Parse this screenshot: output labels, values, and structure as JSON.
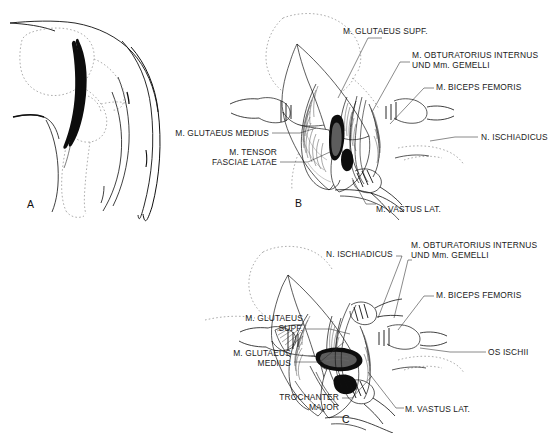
{
  "figure": {
    "kind": "anatomical-surgical-illustration",
    "background_color": "#ffffff",
    "ink_color": "#101010",
    "panels": [
      {
        "id": "A",
        "letter": "A",
        "name": "panel-a-incision-diagram",
        "caption": "",
        "elements": [
          "body-outline",
          "dotted-pelvis-bone",
          "dotted-femur-bone",
          "incision-line"
        ]
      },
      {
        "id": "B",
        "letter": "B",
        "name": "panel-b-superficial-exposure",
        "caption": "",
        "elements": [
          "skin-flap",
          "retractor-left",
          "retractor-right",
          "muscle-bellies",
          "wound-cavity"
        ]
      },
      {
        "id": "C",
        "letter": "C",
        "name": "panel-c-deep-exposure",
        "caption": "",
        "elements": [
          "skin-flap",
          "retractor-left",
          "retractor-right",
          "retractor-lower",
          "muscle-bellies",
          "deep-wound-cavity",
          "bone-surface"
        ]
      }
    ],
    "labels_panel_b": [
      {
        "id": "b-glutaeus-supf",
        "text": "M. GLUTAEUS SUPF.",
        "align": "left"
      },
      {
        "id": "b-obturatorius",
        "text": "M. OBTURATORIUS INTERNUS",
        "align": "left"
      },
      {
        "id": "b-obturatorius-2",
        "text": "UND Mm. GEMELLI",
        "align": "left"
      },
      {
        "id": "b-biceps-femoris",
        "text": "M. BICEPS FEMORIS",
        "align": "left"
      },
      {
        "id": "b-ischiadicus",
        "text": "N. ISCHIADICUS",
        "align": "left"
      },
      {
        "id": "b-glutaeus-medius",
        "text": "M. GLUTAEUS MEDIUS",
        "align": "right"
      },
      {
        "id": "b-tensor-1",
        "text": "M. TENSOR",
        "align": "right"
      },
      {
        "id": "b-tensor-2",
        "text": "FASCIAE LATAE",
        "align": "right"
      },
      {
        "id": "b-vastus-lat",
        "text": "M. VASTUS LAT.",
        "align": "left"
      }
    ],
    "labels_panel_c": [
      {
        "id": "c-ischiadicus",
        "text": "N. ISCHIADICUS",
        "align": "left"
      },
      {
        "id": "c-obturatorius",
        "text": "M. OBTURATORIUS INTERNUS",
        "align": "left"
      },
      {
        "id": "c-obturatorius-2",
        "text": "UND Mm. GEMELLI",
        "align": "left"
      },
      {
        "id": "c-biceps-femoris",
        "text": "M. BICEPS FEMORIS",
        "align": "left"
      },
      {
        "id": "c-glutaeus-supf-1",
        "text": "M. GLUTAEUS",
        "align": "right"
      },
      {
        "id": "c-glutaeus-supf-2",
        "text": "SUPF.",
        "align": "right"
      },
      {
        "id": "c-glutaeus-med-1",
        "text": "M. GLUTAEUS",
        "align": "right"
      },
      {
        "id": "c-glutaeus-med-2",
        "text": "MEDIUS",
        "align": "right"
      },
      {
        "id": "c-os-ischii",
        "text": "OS ISCHII",
        "align": "left"
      },
      {
        "id": "c-trochanter-1",
        "text": "TROCHANTER",
        "align": "right"
      },
      {
        "id": "c-trochanter-2",
        "text": "MAJOR",
        "align": "right"
      },
      {
        "id": "c-vastus-lat",
        "text": "M. VASTUS LAT.",
        "align": "left"
      }
    ]
  }
}
